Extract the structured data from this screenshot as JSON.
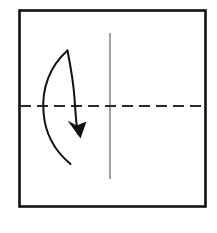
{
  "diagram": {
    "title": "Origami fold step diagram",
    "kind": "paper-folding-instruction",
    "canvas": {
      "width": 217,
      "height": 233,
      "background": "#ffffff"
    },
    "sheet": {
      "label": "Square paper sheet",
      "x": 19.5,
      "y": 10.5,
      "width": 186,
      "height": 196,
      "stroke_color": "#111111",
      "stroke_width": 2.6,
      "fill_color": "#ffffff"
    },
    "creases": [
      {
        "name": "vertical-crease",
        "label": "Vertical valley crease (solid)",
        "style": "solid",
        "orientation": "vertical",
        "x1": 110,
        "y1": 33,
        "x2": 110,
        "y2": 179,
        "stroke_color": "#7a7a7a",
        "stroke_width": 1.4
      },
      {
        "name": "horizontal-crease",
        "label": "Horizontal fold line (dashed)",
        "style": "dashed",
        "orientation": "horizontal",
        "x1": 20,
        "y1": 106,
        "x2": 206,
        "y2": 106,
        "stroke_color": "#2b2b2b",
        "stroke_width": 1.8,
        "dash_pattern": "11 6"
      }
    ],
    "arrow": {
      "name": "fold-direction-arrow",
      "label": "Curved fold arrow pointing down",
      "direction": "down",
      "stroke_color": "#111111",
      "outer_path": "M 67.5 50.5 C 50 66 41.5 88 43.5 112 C 45 134 56 152 70.5 164",
      "inner_path": "M 67.5 50.5 C 70.5 66 73.5 83 74.5 98 C 75.5 112 76 124 78 134",
      "head_path": "M 80.5 138.5 L 67.5 120.5 L 76.5 125.5 L 86.5 121.5 Z",
      "head_tip_x": 80.5,
      "head_tip_y": 138.5
    }
  }
}
